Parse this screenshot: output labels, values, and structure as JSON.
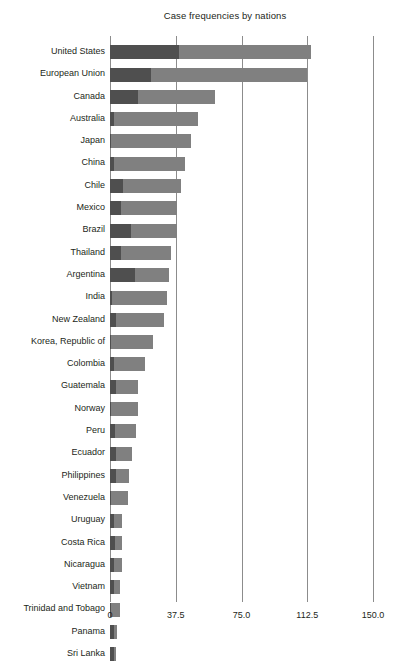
{
  "chart_data": {
    "type": "bar",
    "orientation": "horizontal",
    "stacked": true,
    "title": "Case frequencies by nations",
    "xlabel": "",
    "ylabel": "",
    "xlim": [
      0,
      150
    ],
    "xticks": [
      "0",
      "37.5",
      "75.0",
      "112.5",
      "150.0"
    ],
    "xtick_values": [
      0,
      37.5,
      75,
      112.5,
      150
    ],
    "grid": "vertical",
    "legend": "none",
    "colors": {
      "segment_1": "#4f4f4f",
      "segment_2": "#808080",
      "gridline": "#8c8c8c",
      "text": "#231f20",
      "background": "#ffffff"
    },
    "categories": [
      "United States",
      "European Union",
      "Canada",
      "Australia",
      "Japan",
      "China",
      "Chile",
      "Mexico",
      "Brazil",
      "Thailand",
      "Argentina",
      "India",
      "New Zealand",
      "Korea, Republic of",
      "Colombia",
      "Guatemala",
      "Norway",
      "Peru",
      "Ecuador",
      "Philippines",
      "Venezuela",
      "Uruguay",
      "Costa Rica",
      "Nicaragua",
      "Vietnam",
      "Trinidad and Tobago",
      "Panama",
      "Sri Lanka"
    ],
    "series": [
      {
        "name": "segment-1",
        "color": "#4f4f4f",
        "values": [
          39.5,
          23.5,
          16.0,
          2.5,
          0.8,
          2.0,
          7.5,
          6.2,
          12.0,
          6.0,
          14.0,
          1.2,
          3.2,
          0.8,
          2.0,
          3.2,
          0.8,
          3.0,
          3.5,
          3.2,
          0.8,
          2.5,
          3.0,
          2.5,
          2.5,
          0.8,
          2.5,
          2.0
        ]
      },
      {
        "name": "segment-2",
        "color": "#808080",
        "values": [
          75.0,
          88.8,
          43.7,
          47.5,
          45.2,
          41.0,
          33.2,
          32.3,
          26.0,
          29.0,
          19.5,
          31.6,
          27.8,
          23.8,
          18.0,
          12.8,
          14.9,
          12.0,
          9.2,
          7.6,
          9.2,
          4.5,
          3.6,
          4.5,
          3.2,
          4.9,
          1.3,
          1.5
        ]
      }
    ],
    "totals": [
      114.5,
      112.3,
      59.7,
      50.0,
      46.0,
      43.0,
      40.7,
      38.5,
      38.0,
      35.0,
      33.5,
      32.8,
      31.0,
      24.6,
      20.0,
      16.0,
      15.7,
      15.0,
      12.7,
      10.8,
      10.0,
      7.0,
      6.6,
      7.0,
      5.7,
      5.7,
      3.8,
      3.5
    ]
  }
}
